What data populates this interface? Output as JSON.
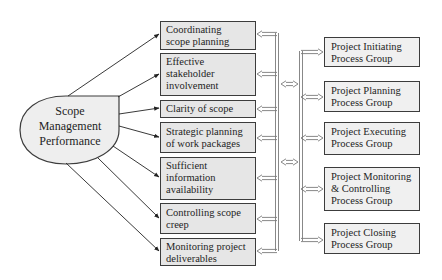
{
  "root": {
    "label_lines": [
      "Scope",
      "Management",
      "Performance"
    ]
  },
  "factors": [
    {
      "lines": [
        "Coordinating",
        "scope planning"
      ]
    },
    {
      "lines": [
        "Effective",
        "stakeholder",
        "involvement"
      ]
    },
    {
      "lines": [
        "Clarity of scope"
      ]
    },
    {
      "lines": [
        "Strategic planning",
        "of work packages"
      ]
    },
    {
      "lines": [
        "Sufficient",
        "information",
        "availability"
      ]
    },
    {
      "lines": [
        "Controlling scope",
        "creep"
      ]
    },
    {
      "lines": [
        "Monitoring project",
        "deliverables"
      ]
    }
  ],
  "process_groups": [
    {
      "lines": [
        "Project Initiating",
        "Process Group"
      ]
    },
    {
      "lines": [
        "Project Planning",
        "Process Group"
      ]
    },
    {
      "lines": [
        "Project Executing",
        "Process Group"
      ]
    },
    {
      "lines": [
        "Project Monitoring",
        "& Controlling",
        "Process Group"
      ]
    },
    {
      "lines": [
        "Project Closing",
        "Process Group"
      ]
    }
  ],
  "colors": {
    "factor_fill": "#e6e6e6",
    "process_fill": "#f0f0f0",
    "root_fill": "#eeeeee",
    "stroke": "#3c3c3c",
    "connector": "#8a8a8a"
  }
}
